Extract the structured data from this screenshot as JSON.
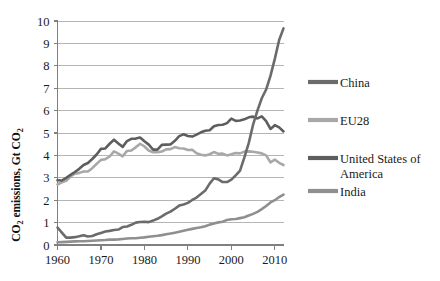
{
  "chart_data": {
    "type": "line",
    "title": "",
    "xlabel": "",
    "ylabel": "CO2 emissions, Gt CO2",
    "ylabel_parts": {
      "pre": "CO",
      "sub1": "2",
      "mid": " emissions, Gt CO",
      "sub2": "2"
    },
    "xlim": [
      1960,
      2012
    ],
    "ylim": [
      0,
      10
    ],
    "grid": true,
    "grid_axis": "y",
    "legend_position": "right",
    "x_ticks": [
      1960,
      1970,
      1980,
      1990,
      2000,
      2010
    ],
    "x_tick_labels": [
      "1960",
      "1970",
      "1980",
      "1990",
      "2000",
      "2010"
    ],
    "y_ticks": [
      0,
      1,
      2,
      3,
      4,
      5,
      6,
      7,
      8,
      9,
      10
    ],
    "y_tick_labels": [
      "0",
      "1",
      "2",
      "3",
      "4",
      "5",
      "6",
      "7",
      "8",
      "9",
      "10"
    ],
    "x": [
      1960,
      1961,
      1962,
      1963,
      1964,
      1965,
      1966,
      1967,
      1968,
      1969,
      1970,
      1971,
      1972,
      1973,
      1974,
      1975,
      1976,
      1977,
      1978,
      1979,
      1980,
      1981,
      1982,
      1983,
      1984,
      1985,
      1986,
      1987,
      1988,
      1989,
      1990,
      1991,
      1992,
      1993,
      1994,
      1995,
      1996,
      1997,
      1998,
      1999,
      2000,
      2001,
      2002,
      2003,
      2004,
      2005,
      2006,
      2007,
      2008,
      2009,
      2010,
      2011,
      2012
    ],
    "series": [
      {
        "name": "China",
        "color": "#6b6b6b",
        "values": [
          0.78,
          0.55,
          0.33,
          0.33,
          0.35,
          0.39,
          0.44,
          0.38,
          0.4,
          0.48,
          0.54,
          0.6,
          0.63,
          0.67,
          0.69,
          0.8,
          0.83,
          0.9,
          1.0,
          1.03,
          1.04,
          1.02,
          1.09,
          1.17,
          1.28,
          1.4,
          1.49,
          1.62,
          1.76,
          1.81,
          1.88,
          2.01,
          2.12,
          2.28,
          2.43,
          2.74,
          2.98,
          2.93,
          2.81,
          2.81,
          2.92,
          3.11,
          3.32,
          3.91,
          4.55,
          5.37,
          6.0,
          6.55,
          6.94,
          7.55,
          8.31,
          9.15,
          9.67
        ]
      },
      {
        "name": "EU28",
        "color": "#a8a8a8",
        "values": [
          2.7,
          2.8,
          2.87,
          3.06,
          3.18,
          3.22,
          3.28,
          3.28,
          3.43,
          3.62,
          3.8,
          3.83,
          3.95,
          4.18,
          4.08,
          3.96,
          4.2,
          4.22,
          4.36,
          4.52,
          4.4,
          4.22,
          4.14,
          4.14,
          4.17,
          4.27,
          4.28,
          4.37,
          4.32,
          4.31,
          4.24,
          4.25,
          4.1,
          4.03,
          4.0,
          4.05,
          4.15,
          4.07,
          4.08,
          4.0,
          4.05,
          4.11,
          4.09,
          4.17,
          4.18,
          4.16,
          4.13,
          4.09,
          4.0,
          3.69,
          3.81,
          3.67,
          3.57
        ]
      },
      {
        "name": "United States of America",
        "color": "#5e5e5e",
        "values": [
          2.89,
          2.88,
          3.0,
          3.13,
          3.26,
          3.4,
          3.57,
          3.66,
          3.84,
          4.04,
          4.29,
          4.31,
          4.52,
          4.7,
          4.53,
          4.38,
          4.64,
          4.74,
          4.75,
          4.8,
          4.63,
          4.48,
          4.26,
          4.26,
          4.47,
          4.48,
          4.49,
          4.65,
          4.86,
          4.94,
          4.87,
          4.84,
          4.93,
          5.03,
          5.1,
          5.12,
          5.3,
          5.36,
          5.37,
          5.44,
          5.64,
          5.54,
          5.56,
          5.61,
          5.7,
          5.73,
          5.65,
          5.74,
          5.53,
          5.18,
          5.35,
          5.25,
          5.07
        ]
      },
      {
        "name": "India",
        "color": "#8f8f8f",
        "values": [
          0.12,
          0.13,
          0.14,
          0.15,
          0.16,
          0.17,
          0.17,
          0.18,
          0.19,
          0.2,
          0.21,
          0.22,
          0.24,
          0.24,
          0.25,
          0.27,
          0.29,
          0.3,
          0.3,
          0.32,
          0.34,
          0.37,
          0.39,
          0.41,
          0.44,
          0.48,
          0.51,
          0.55,
          0.59,
          0.64,
          0.68,
          0.72,
          0.76,
          0.79,
          0.84,
          0.91,
          0.96,
          1.01,
          1.04,
          1.12,
          1.15,
          1.16,
          1.2,
          1.24,
          1.32,
          1.39,
          1.48,
          1.6,
          1.74,
          1.9,
          2.0,
          2.14,
          2.25
        ]
      }
    ]
  },
  "legend": {
    "items": [
      {
        "label": "China",
        "color": "#6b6b6b"
      },
      {
        "label": "EU28",
        "color": "#a8a8a8"
      },
      {
        "label": "United States of",
        "label2": "America",
        "color": "#5e5e5e"
      },
      {
        "label": "India",
        "color": "#8f8f8f"
      }
    ]
  },
  "colors": {
    "axis": "#808080",
    "grid": "#b5b5b5",
    "text": "#1a1a1a",
    "background": "#ffffff"
  }
}
